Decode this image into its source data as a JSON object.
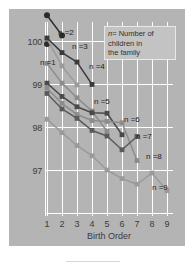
{
  "figure": {
    "panel_color": "#b4b4b4",
    "grid_color": "#ffffff",
    "background": "#ffffff"
  },
  "legend": {
    "symbol": "n",
    "equals": "=",
    "line1": "Number of",
    "line2": "children in",
    "line3": "the family",
    "full_text": "n = Number of children in the family"
  },
  "axes": {
    "xlabel": "Birth Order",
    "ylabel": "",
    "xticks": [
      "1",
      "2",
      "3",
      "4",
      "5",
      "6",
      "7",
      "8",
      "9"
    ],
    "yticks": [
      "100",
      "99",
      "98",
      "97"
    ]
  },
  "series_labels": [
    {
      "id": "n1",
      "text": "n =1"
    },
    {
      "id": "n2",
      "text": "n =2"
    },
    {
      "id": "n3",
      "text": "n =3"
    },
    {
      "id": "n4",
      "text": "n =4"
    },
    {
      "id": "n5",
      "text": "n =5"
    },
    {
      "id": "n6",
      "text": "n =6"
    },
    {
      "id": "n7",
      "text": "n =7"
    },
    {
      "id": "n8",
      "text": "n =8"
    },
    {
      "id": "n9",
      "text": "n =9"
    }
  ],
  "chart_data": {
    "type": "line",
    "title": "",
    "xlabel": "Birth Order",
    "ylabel": "",
    "xlim": [
      0.5,
      9.5
    ],
    "ylim": [
      96.4,
      100.95
    ],
    "grid": true,
    "legend_position": "top-right",
    "x": [
      1,
      2,
      3,
      4,
      5,
      6,
      7,
      8,
      9
    ],
    "series": [
      {
        "name": "n =1",
        "color": "#2b2b2b",
        "x": [
          1
        ],
        "values": [
          99.93
        ]
      },
      {
        "name": "n =2",
        "color": "#2b2b2b",
        "x": [
          1,
          2
        ],
        "values": [
          100.6,
          100.13
        ]
      },
      {
        "name": "n =3",
        "color": "#9a9a9a",
        "x": [
          1,
          2,
          3
        ],
        "values": [
          100.05,
          99.42,
          98.98
        ]
      },
      {
        "name": "n =4",
        "color": "#3a3a3a",
        "x": [
          1,
          2,
          3,
          4
        ],
        "values": [
          100.07,
          99.73,
          99.51,
          98.99
        ]
      },
      {
        "name": "n =5",
        "color": "#8c8c8c",
        "x": [
          1,
          2,
          3,
          4,
          5
        ],
        "values": [
          99.48,
          99.02,
          98.68,
          98.37,
          97.9
        ]
      },
      {
        "name": "n =6",
        "color": "#4a4a4a",
        "x": [
          1,
          2,
          3,
          4,
          5,
          6
        ],
        "values": [
          99.02,
          98.71,
          98.47,
          98.33,
          98.32,
          97.82
        ]
      },
      {
        "name": "n =7",
        "color": "#8c8c8c",
        "x": [
          1,
          2,
          3,
          4,
          5,
          6,
          7
        ],
        "values": [
          98.9,
          98.55,
          98.29,
          98.15,
          98.13,
          98.1,
          97.22
        ]
      },
      {
        "name": "n =8",
        "color": "#5a5a5a",
        "x": [
          1,
          2,
          3,
          4,
          5,
          6,
          7
        ],
        "values": [
          98.78,
          98.42,
          98.2,
          97.92,
          97.79,
          97.47,
          97.78
        ]
      },
      {
        "name": "n =9",
        "color": "#9a9a9a",
        "x": [
          1,
          2,
          3,
          4,
          5,
          6,
          7,
          8,
          9
        ],
        "values": [
          98.18,
          97.87,
          97.57,
          97.33,
          97.0,
          96.8,
          96.67,
          96.93,
          96.52
        ]
      }
    ]
  }
}
